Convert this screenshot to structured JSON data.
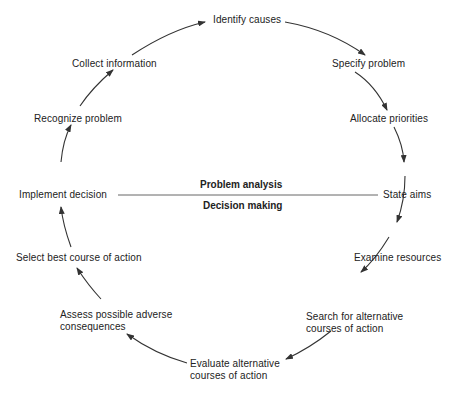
{
  "diagram": {
    "type": "cycle",
    "direction": "clockwise",
    "center": {
      "upper_label": "Problem analysis",
      "lower_label": "Decision making"
    },
    "steps": [
      {
        "id": 1,
        "label": "Identify causes"
      },
      {
        "id": 2,
        "label": "Specify problem"
      },
      {
        "id": 3,
        "label": "Allocate priorities"
      },
      {
        "id": 4,
        "label": "State aims"
      },
      {
        "id": 5,
        "label": "Examine resources"
      },
      {
        "id": 6,
        "label_line1": "Search for alternative",
        "label_line2": "courses of action"
      },
      {
        "id": 7,
        "label_line1": "Evaluate alternative",
        "label_line2": "courses of action"
      },
      {
        "id": 8,
        "label_line1": "Assess possible adverse",
        "label_line2": "consequences"
      },
      {
        "id": 9,
        "label": "Select best course of action"
      },
      {
        "id": 10,
        "label": "Implement decision"
      },
      {
        "id": 11,
        "label": "Recognize problem"
      },
      {
        "id": 12,
        "label": "Collect information"
      }
    ],
    "colors": {
      "line": "#333333",
      "text": "#222222",
      "background": "#ffffff"
    }
  }
}
